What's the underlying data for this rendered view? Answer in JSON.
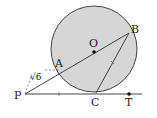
{
  "diagram": {
    "labels": {
      "P": "P",
      "A": "A",
      "O": "O",
      "B": "B",
      "C": "C",
      "T": "T"
    },
    "segment_PA_label": "√6",
    "colors": {
      "circle_fill": "#d6d6d6",
      "stroke": "#444444"
    }
  }
}
